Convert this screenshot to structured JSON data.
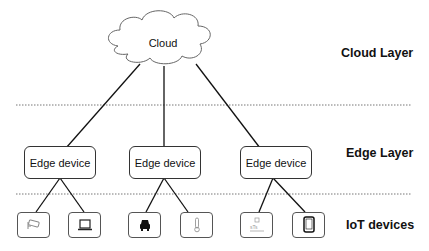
{
  "diagram": {
    "cloud": {
      "label": "Cloud"
    },
    "layers": [
      {
        "label": "Cloud Layer"
      },
      {
        "label": "Edge Layer"
      },
      {
        "label": "IoT devices"
      }
    ],
    "edge_devices": [
      {
        "label": "Edge device"
      },
      {
        "label": "Edge device"
      },
      {
        "label": "Edge device"
      }
    ],
    "iot_devices": [
      {
        "icon": "security-camera-icon",
        "parent": 0
      },
      {
        "icon": "laptop-icon",
        "parent": 0
      },
      {
        "icon": "car-icon",
        "parent": 1
      },
      {
        "icon": "thermometer-icon",
        "parent": 1
      },
      {
        "icon": "smart-meter-icon",
        "parent": 2
      },
      {
        "icon": "tablet-icon",
        "parent": 2
      }
    ],
    "colors": {
      "line": "#111111",
      "box_border": "#333333",
      "divider": "#777777"
    }
  }
}
